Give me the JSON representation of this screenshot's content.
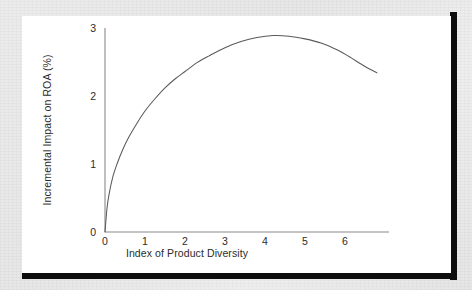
{
  "figure": {
    "background_color": "#e9e9e9",
    "panel_color": "#ffffff",
    "shadow_color": "#0d0d0d",
    "line_color": "#5a5a5a",
    "axis_color": "#8a8a8a",
    "text_color": "#2b2b2b"
  },
  "chart_data": {
    "type": "line",
    "title": "",
    "xlabel": "Index of Product Diversity",
    "ylabel": "Incremental Impact on ROA (%)",
    "xlim": [
      0,
      7.1
    ],
    "ylim": [
      0,
      3.25
    ],
    "xticks": [
      "0",
      "1",
      "2",
      "3",
      "4",
      "5",
      "6"
    ],
    "xtick_values": [
      0,
      1,
      2,
      3,
      4,
      5,
      6
    ],
    "yticks": [
      "0",
      "1",
      "2",
      "3"
    ],
    "ytick_values": [
      0,
      1,
      2,
      3
    ],
    "grid": false,
    "legend": "none",
    "series": [
      {
        "name": "Incremental impact on ROA",
        "x": [
          0.0,
          0.05,
          0.1,
          0.2,
          0.3,
          0.45,
          0.6,
          0.8,
          1.0,
          1.25,
          1.5,
          1.75,
          2.0,
          2.3,
          2.6,
          3.0,
          3.4,
          3.8,
          4.2,
          4.6,
          5.0,
          5.4,
          5.8,
          6.1,
          6.4,
          6.6,
          6.8
        ],
        "y": [
          0.0,
          0.35,
          0.55,
          0.82,
          1.0,
          1.22,
          1.4,
          1.6,
          1.78,
          1.96,
          2.12,
          2.25,
          2.36,
          2.49,
          2.59,
          2.71,
          2.8,
          2.86,
          2.89,
          2.88,
          2.84,
          2.78,
          2.68,
          2.58,
          2.47,
          2.4,
          2.34
        ]
      }
    ],
    "annotations": {
      "peak_x": 4.2,
      "peak_y": 2.89,
      "end_x": 6.8,
      "end_y": 2.34,
      "shape": "inverted-u"
    }
  }
}
